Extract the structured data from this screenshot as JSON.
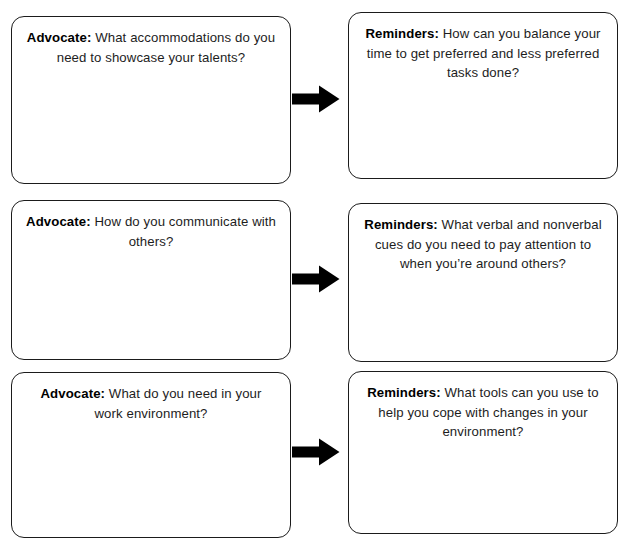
{
  "worksheet": {
    "rows": [
      {
        "left": {
          "label": "Advocate:",
          "text": " What accommodations do you need to showcase your talents?"
        },
        "arrow": "right-arrow-icon",
        "right": {
          "label": "Reminders:",
          "text": " How can you balance your time to get preferred and less preferred tasks done?"
        }
      },
      {
        "left": {
          "label": "Advocate:",
          "text": " How do you communicate with others?"
        },
        "arrow": "right-arrow-icon",
        "right": {
          "label": "Reminders:",
          "text": " What verbal and nonverbal cues do you need to pay attention to when you’re around others?"
        }
      },
      {
        "left": {
          "label": "Advocate:",
          "text": " What do you need in your work environment?"
        },
        "arrow": "right-arrow-icon",
        "right": {
          "label": "Reminders:",
          "text": " What tools can you use to help you cope with changes in your environment?"
        }
      }
    ],
    "colors": {
      "border": "#1b1b1b",
      "text": "#1d1d1d",
      "arrow": "#000000",
      "background": "#ffffff"
    }
  }
}
